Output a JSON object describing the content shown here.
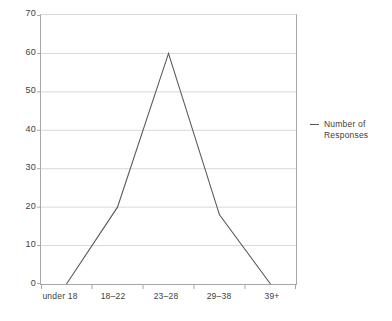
{
  "chart_data": {
    "type": "line",
    "title": "",
    "xlabel": "",
    "ylabel": "",
    "categories": [
      "under 18",
      "18–22",
      "23–28",
      "29–38",
      "39+"
    ],
    "series": [
      {
        "name": "Number of Responses",
        "values": [
          0,
          20,
          60,
          18,
          0
        ]
      }
    ],
    "ylim": [
      0,
      70
    ],
    "yticks": [
      0,
      10,
      20,
      30,
      40,
      50,
      60,
      70
    ],
    "ytick_labels": [
      "0",
      "10",
      "20",
      "30",
      "40",
      "50",
      "60",
      "70"
    ],
    "grid": true,
    "legend_position": "right",
    "legend_marker": "line-dash-marker",
    "colors": {
      "series_line": "#595959",
      "gridline": "#d9d9d9",
      "axis": "#a6a6a6",
      "text": "#404040",
      "background": "#ffffff"
    }
  },
  "legend": {
    "entries": [
      {
        "label": "Number of Responses"
      }
    ]
  },
  "axes": {
    "y_labels": [
      "70",
      "60",
      "50",
      "40",
      "30",
      "20",
      "10",
      "0"
    ],
    "x_labels": [
      "under 18",
      "18–22",
      "23–28",
      "29–38",
      "39+"
    ]
  }
}
